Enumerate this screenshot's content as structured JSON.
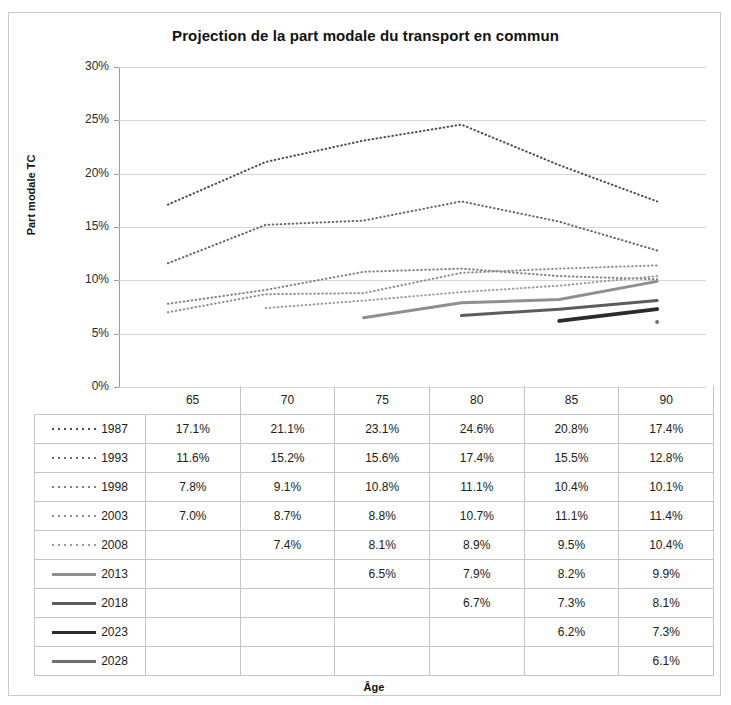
{
  "chart_data": {
    "type": "line",
    "title": "Projection de la part modale du transport en commun",
    "xlabel": "Âge",
    "ylabel": "Part modale TC",
    "categories": [
      "65",
      "70",
      "75",
      "80",
      "85",
      "90"
    ],
    "ylim": [
      0,
      30
    ],
    "yticks": [
      "0%",
      "5%",
      "10%",
      "15%",
      "20%",
      "25%",
      "30%"
    ],
    "ytick_values": [
      0,
      5,
      10,
      15,
      20,
      25,
      30
    ],
    "grid": true,
    "legend_position": "table-below",
    "series": [
      {
        "name": "1987",
        "style": "dotted",
        "color": "#4a4a4a",
        "width": 2,
        "values": [
          17.1,
          21.1,
          23.1,
          24.6,
          20.8,
          17.4
        ],
        "labels": [
          "17.1%",
          "21.1%",
          "23.1%",
          "24.6%",
          "20.8%",
          "17.4%"
        ]
      },
      {
        "name": "1993",
        "style": "dotted",
        "color": "#666666",
        "width": 2,
        "values": [
          11.6,
          15.2,
          15.6,
          17.4,
          15.5,
          12.8
        ],
        "labels": [
          "11.6%",
          "15.2%",
          "15.6%",
          "17.4%",
          "15.5%",
          "12.8%"
        ]
      },
      {
        "name": "1998",
        "style": "dotted",
        "color": "#808080",
        "width": 2,
        "values": [
          7.8,
          9.1,
          10.8,
          11.1,
          10.4,
          10.1
        ],
        "labels": [
          "7.8%",
          "9.1%",
          "10.8%",
          "11.1%",
          "10.4%",
          "10.1%"
        ]
      },
      {
        "name": "2003",
        "style": "dotted",
        "color": "#8c8c8c",
        "width": 2,
        "values": [
          7.0,
          8.7,
          8.8,
          10.7,
          11.1,
          11.4
        ],
        "labels": [
          "7.0%",
          "8.7%",
          "8.8%",
          "10.7%",
          "11.1%",
          "11.4%"
        ]
      },
      {
        "name": "2008",
        "style": "dotted",
        "color": "#9a9a9a",
        "width": 2,
        "values": [
          null,
          7.4,
          8.1,
          8.9,
          9.5,
          10.4
        ],
        "labels": [
          "",
          "7.4%",
          "8.1%",
          "8.9%",
          "9.5%",
          "10.4%"
        ]
      },
      {
        "name": "2013",
        "style": "solid",
        "color": "#8f8f8f",
        "width": 3,
        "values": [
          null,
          null,
          6.5,
          7.9,
          8.2,
          9.9
        ],
        "labels": [
          "",
          "",
          "6.5%",
          "7.9%",
          "8.2%",
          "9.9%"
        ]
      },
      {
        "name": "2018",
        "style": "solid",
        "color": "#5c5c5c",
        "width": 3,
        "values": [
          null,
          null,
          null,
          6.7,
          7.3,
          8.1
        ],
        "labels": [
          "",
          "",
          "",
          "6.7%",
          "7.3%",
          "8.1%"
        ]
      },
      {
        "name": "2023",
        "style": "solid",
        "color": "#2b2b2b",
        "width": 4,
        "values": [
          null,
          null,
          null,
          null,
          6.2,
          7.3
        ],
        "labels": [
          "",
          "",
          "",
          "",
          "6.2%",
          "7.3%"
        ]
      },
      {
        "name": "2028",
        "style": "solid",
        "color": "#6e6e6e",
        "width": 4,
        "values": [
          null,
          null,
          null,
          null,
          null,
          6.1
        ],
        "labels": [
          "",
          "",
          "",
          "",
          "",
          "6.1%"
        ]
      }
    ]
  },
  "table": {
    "header": [
      "",
      "65",
      "70",
      "75",
      "80",
      "85",
      "90"
    ],
    "rows": [
      {
        "year": "1987",
        "cells": [
          "17.1%",
          "21.1%",
          "23.1%",
          "24.6%",
          "20.8%",
          "17.4%"
        ]
      },
      {
        "year": "1993",
        "cells": [
          "11.6%",
          "15.2%",
          "15.6%",
          "17.4%",
          "15.5%",
          "12.8%"
        ]
      },
      {
        "year": "1998",
        "cells": [
          "7.8%",
          "9.1%",
          "10.8%",
          "11.1%",
          "10.4%",
          "10.1%"
        ]
      },
      {
        "year": "2003",
        "cells": [
          "7.0%",
          "8.7%",
          "8.8%",
          "10.7%",
          "11.1%",
          "11.4%"
        ]
      },
      {
        "year": "2008",
        "cells": [
          "",
          "7.4%",
          "8.1%",
          "8.9%",
          "9.5%",
          "10.4%"
        ]
      },
      {
        "year": "2013",
        "cells": [
          "",
          "",
          "6.5%",
          "7.9%",
          "8.2%",
          "9.9%"
        ]
      },
      {
        "year": "2018",
        "cells": [
          "",
          "",
          "",
          "6.7%",
          "7.3%",
          "8.1%"
        ]
      },
      {
        "year": "2023",
        "cells": [
          "",
          "",
          "",
          "",
          "6.2%",
          "7.3%"
        ]
      },
      {
        "year": "2028",
        "cells": [
          "",
          "",
          "",
          "",
          "",
          "6.1%"
        ]
      }
    ]
  },
  "colors": {
    "gridline": "#d5d5d5",
    "axis": "#9a9a9a",
    "border": "#c9c9c9",
    "text": "#1b1b1b",
    "background": "#ffffff"
  }
}
